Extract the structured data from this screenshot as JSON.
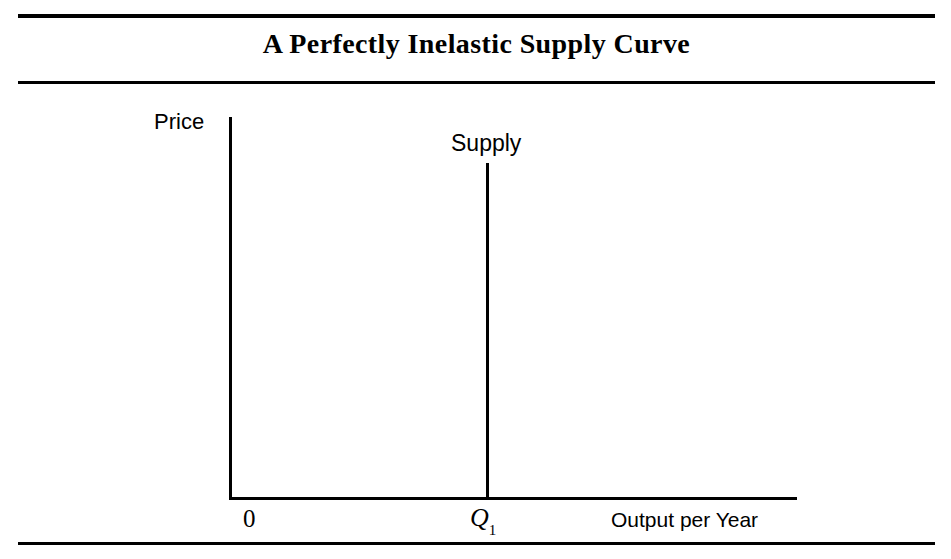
{
  "figure": {
    "title": "A Perfectly Inelastic Supply Curve",
    "background_color": "#ffffff",
    "line_color": "#000000"
  },
  "axes": {
    "y_axis_label": "Price",
    "x_axis_label": "Output per Year",
    "origin_label": "0"
  },
  "annotations": {
    "supply_curve_label": "Supply",
    "quantity_tick_label": "Q",
    "quantity_tick_subscript": "1"
  },
  "chart_data": {
    "type": "line",
    "title": "A Perfectly Inelastic Supply Curve",
    "xlabel": "Output per Year",
    "ylabel": "Price",
    "grid": false,
    "legend": "none",
    "xlim": [
      0,
      1
    ],
    "ylim": [
      0,
      1
    ],
    "xticks": [
      0,
      0.452
    ],
    "xticklabels": [
      "0",
      "Q1"
    ],
    "yticks": [],
    "yticklabels": [],
    "series": [
      {
        "name": "Supply",
        "description": "Perfectly inelastic (vertical) supply curve at quantity Q1",
        "x": [
          0.452,
          0.452
        ],
        "y": [
          0.0,
          0.883
        ],
        "elasticity": 0
      }
    ],
    "annotations": [
      {
        "text": "Supply",
        "x": 0.44,
        "y": 0.94
      },
      {
        "text": "Price",
        "x": -0.13,
        "y": 1.01
      },
      {
        "text": "Output per Year",
        "x": 0.67,
        "y": -0.04
      }
    ]
  }
}
